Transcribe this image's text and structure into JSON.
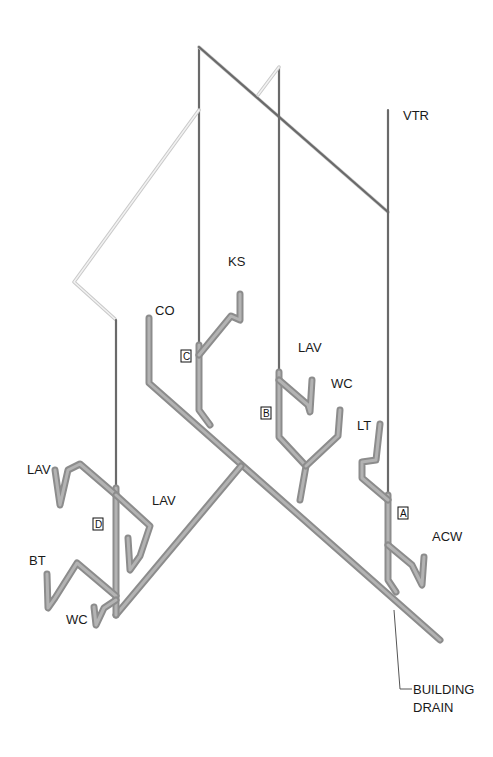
{
  "diagram": {
    "type": "isometric plumbing DWV riser diagram",
    "fixture_labels": {
      "vtr": "VTR",
      "ks": "KS",
      "co": "CO",
      "lav_b": "LAV",
      "wc_b": "WC",
      "lt": "LT",
      "acw": "ACW",
      "lav_d_left": "LAV",
      "lav_d_right": "LAV",
      "bt": "BT",
      "wc_d": "WC"
    },
    "stack_markers": {
      "a": "A",
      "b": "B",
      "c": "C",
      "d": "D"
    },
    "callout": {
      "line1": "BUILDING",
      "line2": "DRAIN"
    },
    "colors": {
      "vent_pipe": "#6a6a6a",
      "drain_pipe": "#8c8c8c",
      "background": "#ffffff"
    }
  }
}
